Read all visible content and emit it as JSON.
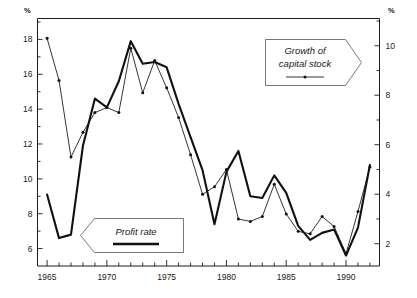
{
  "chart_data": {
    "type": "line",
    "title": "",
    "xlabel": "",
    "ylabel": "%",
    "y2label": "%",
    "x": [
      1965,
      1966,
      1967,
      1968,
      1969,
      1970,
      1971,
      1972,
      1973,
      1974,
      1975,
      1976,
      1977,
      1978,
      1979,
      1980,
      1981,
      1982,
      1983,
      1984,
      1985,
      1986,
      1987,
      1988,
      1989,
      1990,
      1991,
      1992
    ],
    "xlim": [
      1964.2,
      1992.8
    ],
    "ylim": [
      5.0,
      19.2
    ],
    "y2lim": [
      1.1,
      11.1
    ],
    "yticks": [
      6,
      8,
      10,
      12,
      14,
      16,
      18
    ],
    "y2ticks": [
      2,
      4,
      6,
      8,
      10
    ],
    "xticks_labeled": [
      1965,
      1970,
      1975,
      1980,
      1985,
      1990
    ],
    "xticks_minor_every": 1,
    "grid": false,
    "legend_position": "inside",
    "series": [
      {
        "name": "Profit rate",
        "axis": "left",
        "style": "thick",
        "markers": false,
        "values": [
          9.1,
          6.6,
          6.8,
          11.9,
          14.6,
          14.1,
          15.6,
          17.9,
          16.6,
          16.7,
          16.4,
          14.3,
          12.4,
          10.5,
          7.4,
          10.4,
          11.6,
          9.0,
          8.9,
          10.2,
          9.2,
          7.3,
          6.5,
          6.9,
          7.1,
          5.6,
          7.2,
          10.8
        ]
      },
      {
        "name": "Growth of capital stock",
        "axis": "right",
        "style": "thin",
        "markers": true,
        "values": [
          10.3,
          8.6,
          5.5,
          6.5,
          7.3,
          7.5,
          7.3,
          9.9,
          8.1,
          9.4,
          8.3,
          7.1,
          5.6,
          4.0,
          4.3,
          5.0,
          3.0,
          2.9,
          3.1,
          4.4,
          3.2,
          2.5,
          2.4,
          3.1,
          2.7,
          1.6,
          3.3,
          5.1
        ]
      }
    ],
    "annotations": [
      {
        "id": "callout-profit-rate",
        "label": "Profit rate",
        "pointer": "left",
        "sample": "thick-line"
      },
      {
        "id": "callout-capital-stock",
        "label_line1": "Growth of",
        "label_line2": "capital stock",
        "pointer": "right",
        "sample": "thin-line-marker"
      }
    ]
  },
  "axes": {
    "left_unit": "%",
    "right_unit": "%",
    "left_ticks": [
      "18",
      "16",
      "14",
      "12",
      "10",
      "8",
      "6"
    ],
    "right_ticks": [
      "10",
      "8",
      "6",
      "4",
      "2"
    ],
    "x_ticks": [
      "1965",
      "1970",
      "1975",
      "1980",
      "1985",
      "1990"
    ]
  },
  "callouts": {
    "profit_rate": "Profit rate",
    "capital_stock_line1": "Growth of",
    "capital_stock_line2": "capital stock"
  }
}
